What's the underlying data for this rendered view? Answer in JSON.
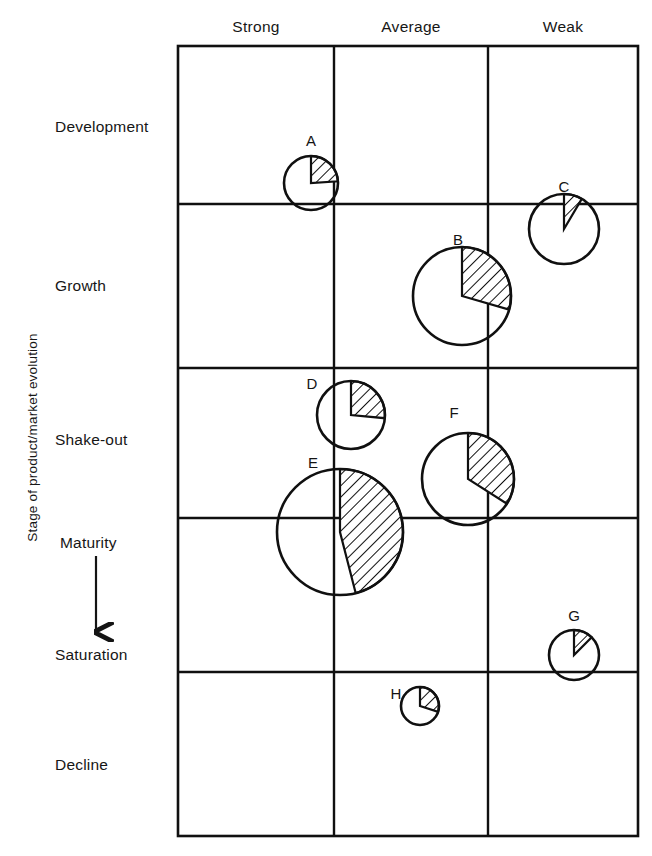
{
  "figure": {
    "y_axis_title": "Stage of product/market evolution",
    "columns": [
      {
        "label": "Strong",
        "center_x": 256
      },
      {
        "label": "Average",
        "center_x": 411
      },
      {
        "label": "Weak",
        "center_x": 563
      }
    ],
    "rows": [
      {
        "label": "Development",
        "label_y": 127
      },
      {
        "label": "Growth",
        "label_y": 286
      },
      {
        "label": "Shake-out",
        "label_y": 440
      },
      {
        "label": "Maturity",
        "label_y": 543
      },
      {
        "label": "Saturation",
        "label_y": 655
      },
      {
        "label": "Decline",
        "label_y": 765
      }
    ],
    "arrow": {
      "name": "maturity-to-saturation-arrow",
      "x": 96,
      "y_top": 556,
      "y_bottom": 632
    },
    "plot_area": {
      "left": 178,
      "top": 46,
      "right": 638,
      "bottom": 836
    },
    "column_dividers_x": [
      334,
      488
    ],
    "row_dividers_y": [
      204,
      368,
      518,
      672
    ],
    "line_color": "#101010",
    "hatch_color": "#101010",
    "background_color": "#ffffff"
  },
  "chart_data": {
    "type": "scatter",
    "title": "",
    "subtitle": "",
    "xlabel": "",
    "ylabel": "Stage of product/market evolution",
    "x_categories": [
      "Strong",
      "Average",
      "Weak"
    ],
    "y_categories": [
      "Development",
      "Growth",
      "Shake-out",
      "Maturity",
      "Saturation",
      "Decline"
    ],
    "grid": true,
    "legend": "none",
    "encoding": {
      "circle_area": "relative business size",
      "hatched_wedge": "relative market share"
    },
    "points": [
      {
        "label": "A",
        "competitive_position": "Strong",
        "stage": "Development",
        "cx": 311,
        "cy": 183,
        "r": 27,
        "share_fraction": 0.24,
        "label_x": 311,
        "label_y": 140
      },
      {
        "label": "C",
        "competitive_position": "Weak",
        "stage": "Development",
        "cx": 564,
        "cy": 229,
        "r": 35,
        "share_fraction": 0.085,
        "label_x": 564,
        "label_y": 186
      },
      {
        "label": "B",
        "competitive_position": "Average",
        "stage": "Growth",
        "cx": 462,
        "cy": 296,
        "r": 49,
        "share_fraction": 0.295,
        "label_x": 458,
        "label_y": 239
      },
      {
        "label": "D",
        "competitive_position": "Strong",
        "stage": "Shake-out",
        "cx": 351,
        "cy": 415,
        "r": 34,
        "share_fraction": 0.265,
        "label_x": 312,
        "label_y": 383
      },
      {
        "label": "F",
        "competitive_position": "Average",
        "stage": "Shake-out",
        "cx": 468,
        "cy": 479,
        "r": 46,
        "share_fraction": 0.34,
        "label_x": 454,
        "label_y": 412
      },
      {
        "label": "E",
        "competitive_position": "Strong",
        "stage": "Maturity",
        "cx": 340,
        "cy": 532,
        "r": 63,
        "share_fraction": 0.46,
        "label_x": 313,
        "label_y": 462
      },
      {
        "label": "G",
        "competitive_position": "Weak",
        "stage": "Saturation",
        "cx": 574,
        "cy": 655,
        "r": 25,
        "share_fraction": 0.125,
        "label_x": 574,
        "label_y": 615
      },
      {
        "label": "H",
        "competitive_position": "Average",
        "stage": "Decline",
        "cx": 420,
        "cy": 706,
        "r": 19,
        "share_fraction": 0.3,
        "label_x": 396,
        "label_y": 693
      }
    ]
  }
}
